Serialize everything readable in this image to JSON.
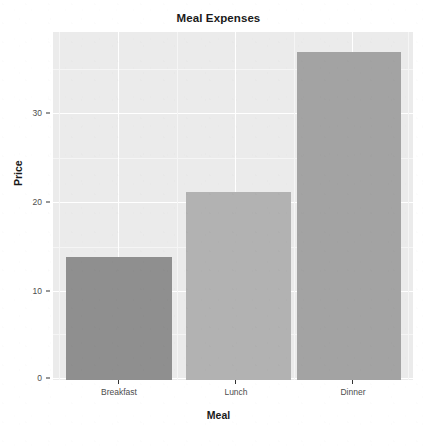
{
  "chart_data": {
    "type": "bar",
    "title": "Meal Expenses",
    "xlabel": "Meal",
    "ylabel": "Price",
    "categories": [
      "Breakfast",
      "Lunch",
      "Dinner"
    ],
    "values": [
      14.0,
      21.4,
      37.4
    ],
    "bar_colors": [
      "#8f8f8f",
      "#b2b2b2",
      "#a3a3a3"
    ],
    "ylim": [
      0,
      39.4
    ],
    "y_ticks": [
      0,
      10,
      20,
      30
    ],
    "y_tick_labels": [
      "0",
      "10",
      "20",
      "30"
    ],
    "y_minor_ticks": [
      5,
      15,
      25,
      35
    ],
    "grid": true,
    "grid_color": "#ffffff",
    "panel_background": "#ebebeb",
    "legend": "none",
    "legend_position": "none"
  },
  "axes": {
    "y_tick_labels": [
      "30",
      "20",
      "10",
      "0"
    ],
    "x_tick_labels": [
      "Breakfast",
      "Lunch",
      "Dinner"
    ]
  }
}
